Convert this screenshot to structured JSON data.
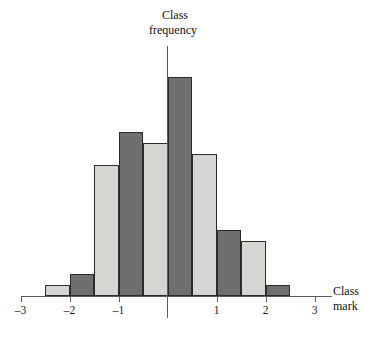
{
  "chart_data": {
    "type": "bar",
    "title": "",
    "subtitle": "",
    "xlabel_lines": [
      "Class",
      "mark"
    ],
    "ylabel_lines": [
      "Class",
      "frequency"
    ],
    "xlabel": "Class mark",
    "ylabel": "Class frequency",
    "grid": false,
    "legend": "none",
    "xlim": [
      -3.25,
      3.25
    ],
    "ylim": [
      0,
      21
    ],
    "bin_width": 0.5,
    "xticks": [
      -3,
      -2,
      -1,
      1,
      2,
      3
    ],
    "xtick_labels": [
      "–3",
      "–2",
      "–1",
      "1",
      "2",
      "3"
    ],
    "yticks": [],
    "ytick_labels": [],
    "colors": {
      "light_bar": "#d6d5d1",
      "dark_bar": "#6f6f6f",
      "bar_outline": "#2b2b2b",
      "axis": "#5d5d5d",
      "text": "#111111",
      "background": "#ffffff"
    },
    "bars": [
      {
        "name": "bin-1",
        "x_left": -2.5,
        "x_right": -2.0,
        "class_mark": -2.25,
        "value": 1,
        "shade": "light"
      },
      {
        "name": "bin-2",
        "x_left": -2.0,
        "x_right": -1.5,
        "class_mark": -1.75,
        "value": 2,
        "shade": "dark"
      },
      {
        "name": "bin-3",
        "x_left": -1.5,
        "x_right": -1.0,
        "class_mark": -1.25,
        "value": 12,
        "shade": "light"
      },
      {
        "name": "bin-4",
        "x_left": -1.0,
        "x_right": -0.5,
        "class_mark": -0.75,
        "value": 15,
        "shade": "dark"
      },
      {
        "name": "bin-5",
        "x_left": -0.5,
        "x_right": 0.0,
        "class_mark": -0.25,
        "value": 14,
        "shade": "light"
      },
      {
        "name": "bin-6",
        "x_left": 0.0,
        "x_right": 0.5,
        "class_mark": 0.25,
        "value": 20,
        "shade": "dark"
      },
      {
        "name": "bin-7",
        "x_left": 0.5,
        "x_right": 1.0,
        "class_mark": 0.75,
        "value": 13,
        "shade": "light"
      },
      {
        "name": "bin-8",
        "x_left": 1.0,
        "x_right": 1.5,
        "class_mark": 1.25,
        "value": 6,
        "shade": "dark"
      },
      {
        "name": "bin-9",
        "x_left": 1.5,
        "x_right": 2.0,
        "class_mark": 1.75,
        "value": 5,
        "shade": "light"
      },
      {
        "name": "bin-10",
        "x_left": 2.0,
        "x_right": 2.5,
        "class_mark": 2.25,
        "value": 1,
        "shade": "dark"
      }
    ]
  }
}
